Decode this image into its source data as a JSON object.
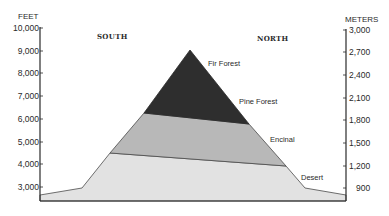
{
  "diagram": {
    "left_axis": {
      "title": "FEET",
      "ticks": [
        "10,000",
        "9,000",
        "8,000",
        "7,000",
        "6,000",
        "5,000",
        "4,000",
        "3,000"
      ]
    },
    "right_axis": {
      "title": "METERS",
      "ticks": [
        "3,000",
        "2,700",
        "2,400",
        "2,100",
        "1,800",
        "1,500",
        "1,200",
        "900"
      ]
    },
    "directions": {
      "south": "SOUTH",
      "north": "NORTH"
    },
    "zones": [
      {
        "name": "Fir Forest",
        "color": "#2e2e2e"
      },
      {
        "name": "Pine Forest",
        "color": "#2e2e2e"
      },
      {
        "name": "Encinal",
        "color": "#b8b8b8"
      },
      {
        "name": "Desert",
        "color": "#e2e2e2"
      }
    ],
    "colors": {
      "forest": "#2e2e2e",
      "encinal": "#b8b8b8",
      "desert": "#e2e2e2",
      "axis": "#2a2a2a"
    }
  }
}
